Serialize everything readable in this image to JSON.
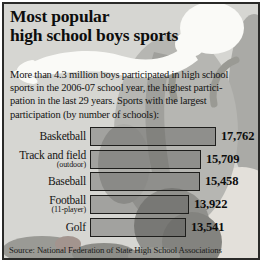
{
  "header": {
    "title_line1": "Most popular",
    "title_line2": "high school boys sports"
  },
  "intro": {
    "lines": [
      "More than 4.3 million boys participated in high school",
      "sports in the 2006-07 school year, the highest partici-",
      "pation in the last 29 years. Sports with the largest",
      "participation (by number of schools):"
    ]
  },
  "chart_data": {
    "type": "bar",
    "orientation": "horizontal",
    "categories": [
      "Basketball",
      "Track and field",
      "Baseball",
      "Football",
      "Golf"
    ],
    "sublabels": [
      "",
      "(outdoor)",
      "",
      "(11-player)",
      ""
    ],
    "values": [
      17762,
      15709,
      15458,
      13922,
      13541
    ],
    "value_labels": [
      "17,762",
      "15,709",
      "15,458",
      "13,922",
      "13,541"
    ],
    "unit": "number of schools",
    "xlim": [
      0,
      17762
    ],
    "grid": false,
    "legend": "none"
  },
  "footer": {
    "source": "Source: National Federation of State High School Associations"
  },
  "colors": {
    "background": "#d6d6d2",
    "frame_border": "#2a2a28",
    "bar_fill": "rgba(86,86,82,0.40)",
    "bar_border": "#1e1e1c",
    "text": "#0d0d0c",
    "figure_white": "#fafaf7",
    "figure_gray": "#b6b6b2"
  }
}
